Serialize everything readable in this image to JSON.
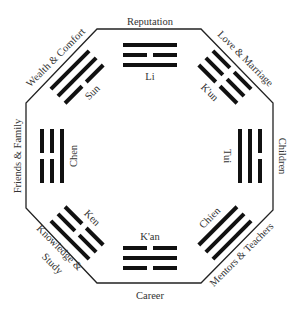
{
  "colors": {
    "line": "#111111",
    "text": "#333333",
    "background": "#ffffff"
  },
  "areas": {
    "top": "Reputation",
    "top_right": "Love & Marriage",
    "right": "Children",
    "bottom_right": "Mentors & Teachers",
    "bottom": "Career",
    "bottom_left_1": "Knowledge &",
    "bottom_left_2": "Study",
    "left": "Friends & Family",
    "top_left": "Wealth & Comfort"
  },
  "trigrams": {
    "top": {
      "name": "Li",
      "lines_outer_to_inner": [
        "solid",
        "broken",
        "solid"
      ]
    },
    "top_right": {
      "name": "K'un",
      "lines_outer_to_inner": [
        "broken",
        "broken",
        "broken"
      ]
    },
    "right": {
      "name": "Tui",
      "lines_outer_to_inner": [
        "broken",
        "solid",
        "solid"
      ]
    },
    "bottom_right": {
      "name": "Chien",
      "lines_outer_to_inner": [
        "solid",
        "solid",
        "solid"
      ]
    },
    "bottom": {
      "name": "K'an",
      "lines_outer_to_inner": [
        "broken",
        "solid",
        "broken"
      ]
    },
    "bottom_left": {
      "name": "Ken",
      "lines_outer_to_inner": [
        "solid",
        "broken",
        "broken"
      ]
    },
    "left": {
      "name": "Chen",
      "lines_outer_to_inner": [
        "broken",
        "broken",
        "solid"
      ]
    },
    "top_left": {
      "name": "Sun",
      "lines_outer_to_inner": [
        "solid",
        "solid",
        "broken"
      ]
    }
  }
}
